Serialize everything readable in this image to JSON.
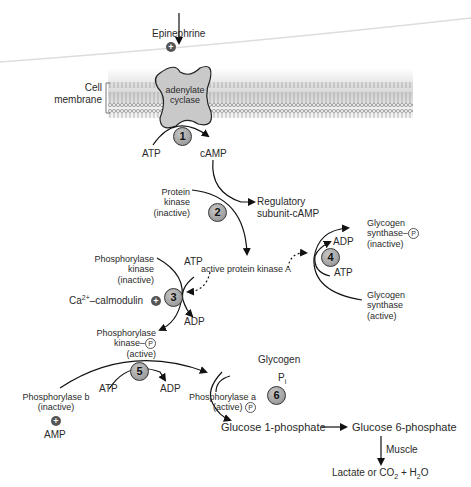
{
  "membrane": {
    "label_line1": "Cell",
    "label_line2": "membrane",
    "enzyme_line1": "adenylate",
    "enzyme_line2": "cyclase"
  },
  "hormone": {
    "label": "Epinephrine",
    "effect": "+"
  },
  "steps": [
    {
      "number": "1",
      "input": "ATP",
      "output": "cAMP"
    },
    {
      "number": "2",
      "input": "Protein kinase (inactive)",
      "output": "active protein kinase A",
      "byproduct": "Regulatory subunit-cAMP"
    },
    {
      "number": "3",
      "input": "Phosphorylase kinase (inactive)",
      "output": "Phosphorylase kinase–P (active)",
      "cofactor_in": "ATP",
      "cofactor_out": "ADP",
      "activator": "Ca2+–calmodulin"
    },
    {
      "number": "4",
      "input": "Glycogen synthase (active)",
      "output": "Glycogen synthase–P (inactive)",
      "cofactor_in": "ATP",
      "cofactor_out": "ADP"
    },
    {
      "number": "5",
      "input": "Phosphorylase b (inactive)",
      "output": "Phosphorylase a (active) P",
      "cofactor_in": "ATP",
      "cofactor_out": "ADP",
      "activator": "AMP"
    },
    {
      "number": "6",
      "input": "Glycogen",
      "cofactor_in": "Pi",
      "output": "Glucose 1-phosphate"
    }
  ],
  "labels": {
    "atp1": "ATP",
    "camp": "cAMP",
    "pk_l1": "Protein",
    "pk_l2": "kinase",
    "pk_l3": "(inactive)",
    "reg_l1": "Regulatory",
    "reg_l2": "subunit-cAMP",
    "pka": "active protein kinase A",
    "gsp_l1": "Glycogen",
    "gsp_l2": "synthase–",
    "gsp_l3": "(inactive)",
    "adp4": "ADP",
    "atp4": "ATP",
    "gs_l1": "Glycogen",
    "gs_l2": "synthase",
    "gs_l3": "(active)",
    "phk_l1": "Phosphorylase",
    "phk_l2": "kinase",
    "phk_l3": "(inactive)",
    "atp3": "ATP",
    "adp3": "ADP",
    "ca": "–calmodulin",
    "ca_base": "Ca",
    "ca_sup": "2+",
    "phkp_l1": "Phosphorylase",
    "phkp_l2": "kinase–",
    "phkp_l3": "(active)",
    "atp5": "ATP",
    "adp5": "ADP",
    "phb_l1": "Phosphorylase b",
    "phb_l2": "(inactive)",
    "amp": "AMP",
    "pha_l1": "Phosphorylase a",
    "pha_l2": "(active)",
    "glycogen": "Glycogen",
    "pi_base": "P",
    "pi_sub": "i",
    "g1p": "Glucose 1-phosphate",
    "g6p": "Glucose 6-phosphate",
    "muscle": "Muscle",
    "final_a": "Lactate or CO",
    "final_sub1": "2",
    "final_b": " + H",
    "final_sub2": "2",
    "final_c": "O",
    "phospho": "P",
    "plus": "+"
  }
}
